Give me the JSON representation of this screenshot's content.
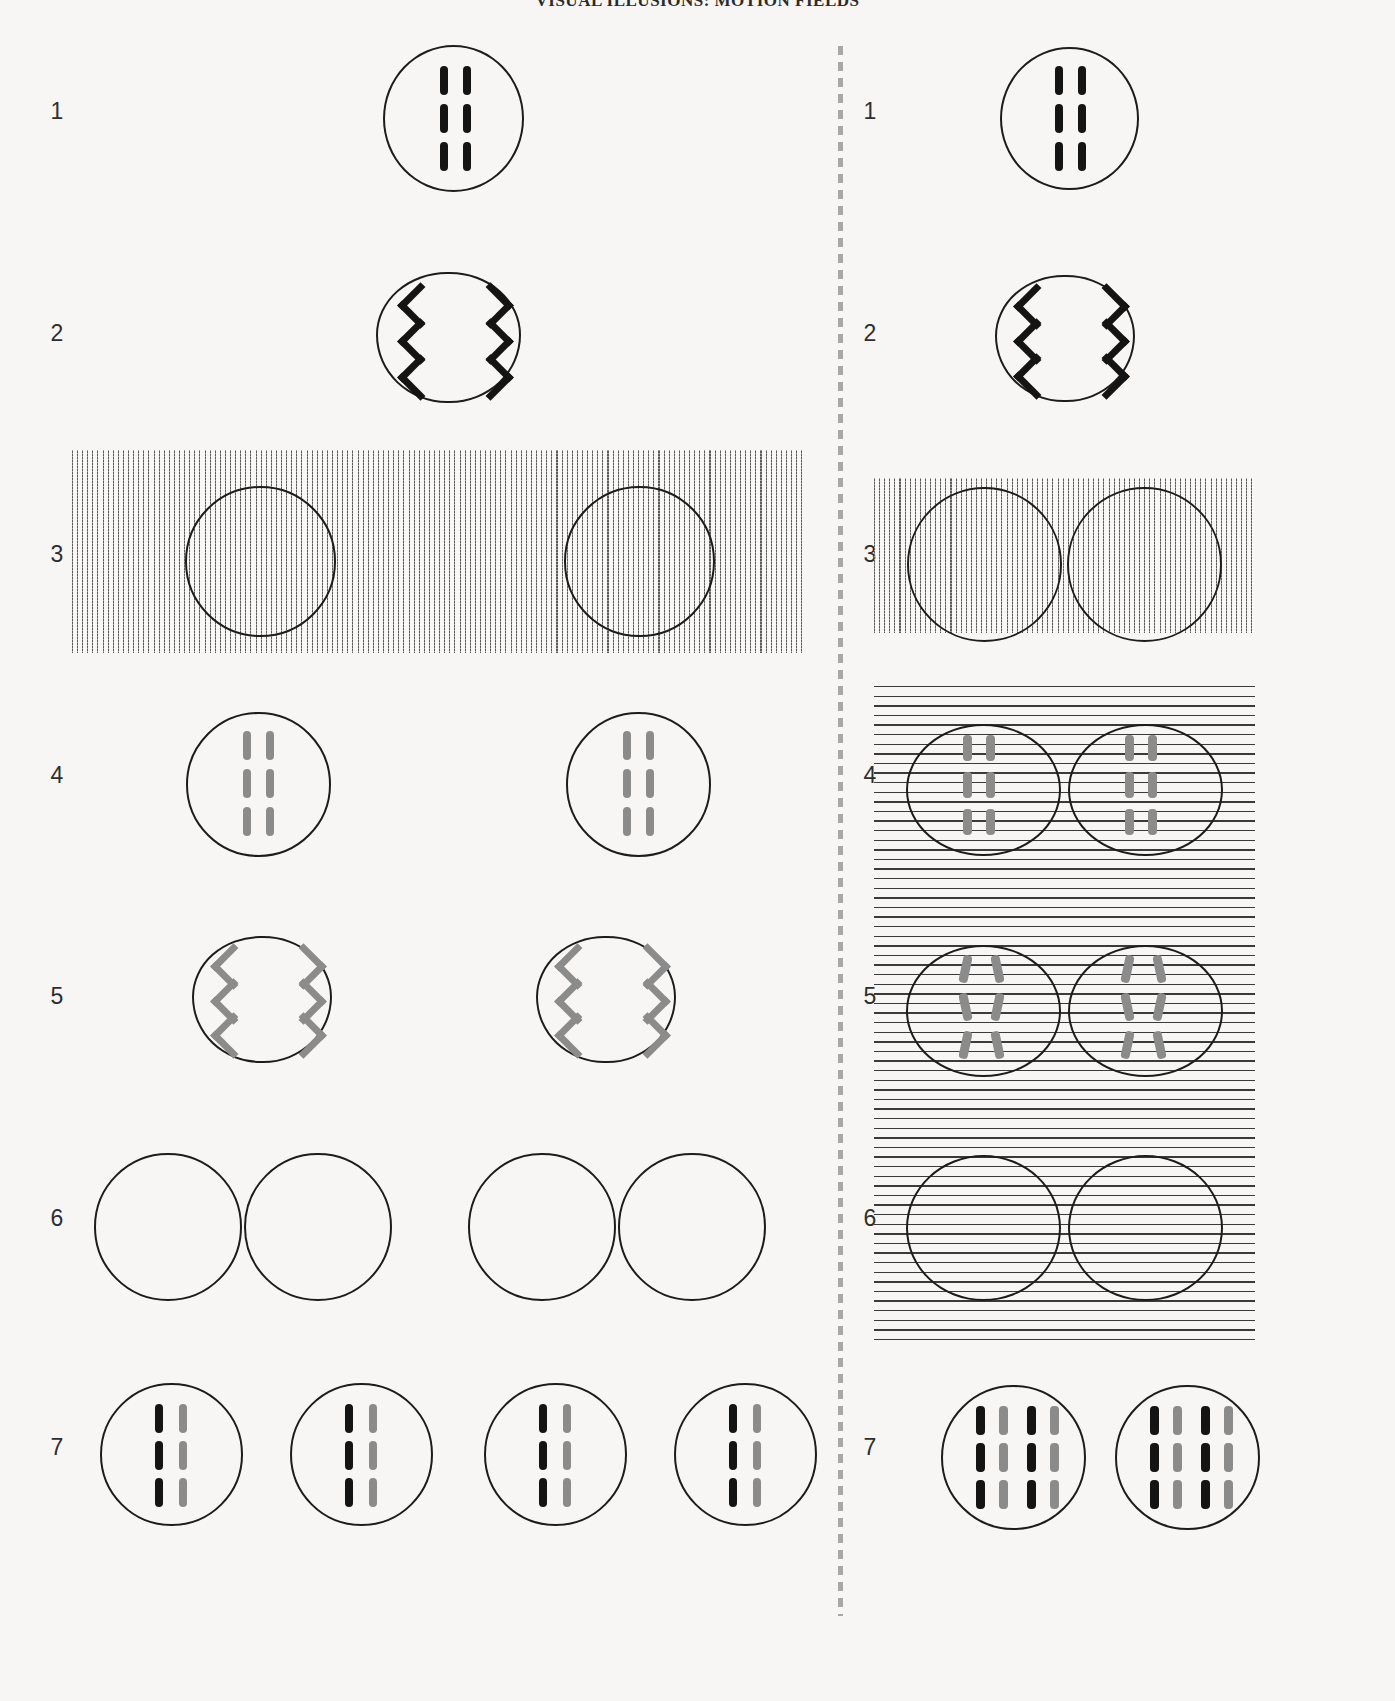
{
  "plate": {
    "title": "VISUAL ILLUSIONS: MOTION FIELDS",
    "background_color": "#f7f6f4",
    "ink_black": "#141414",
    "ink_gray": "#8b8b8b",
    "divider_style": "dashed-vertical",
    "columns": 2
  },
  "row_numbers": {
    "r1": "1",
    "r2": "2",
    "r3": "3",
    "r4": "4",
    "r5": "5",
    "r6": "6",
    "r7": "7"
  },
  "left_column": {
    "rows": [
      {
        "number": "1",
        "description": "single circle containing six black vertical bars in three rows of two",
        "circles": 1,
        "bar_color": "#141414",
        "bar_orientation": "vertical",
        "bar_rows": 3,
        "bar_cols": 2,
        "background_field": "none"
      },
      {
        "number": "2",
        "description": "single scalloped circle containing three pairs of black chevrons pointing outward",
        "circles": 1,
        "glyph": "chevron",
        "glyph_color": "#141414",
        "glyph_rows": 3,
        "background_field": "none"
      },
      {
        "number": "3",
        "description": "wide field of fine vertical lines with two empty outlined circles spaced apart",
        "circles": 2,
        "background_field": "vertical-lines",
        "field_width_px": 730
      },
      {
        "number": "4",
        "description": "two separated circles each with six gray vertical bars",
        "circles": 2,
        "bar_color": "#8b8b8b",
        "bar_orientation": "vertical",
        "bar_rows": 3,
        "bar_cols": 2,
        "background_field": "none"
      },
      {
        "number": "5",
        "description": "two separated scalloped circles each with three pairs of gray chevrons",
        "circles": 2,
        "glyph": "chevron",
        "glyph_color": "#8b8b8b",
        "glyph_rows": 3,
        "background_field": "none"
      },
      {
        "number": "6",
        "description": "four empty outlined circles arranged as two touching pairs",
        "circles": 4,
        "background_field": "none"
      },
      {
        "number": "7",
        "description": "four circles each with three rows of one black bar beside one gray bar",
        "circles": 4,
        "bar_colors": [
          "#141414",
          "#8b8b8b"
        ],
        "bar_orientation": "vertical",
        "bar_rows": 3,
        "bar_cols": 2,
        "background_field": "none"
      }
    ]
  },
  "right_column": {
    "rows": [
      {
        "number": "1",
        "description": "single circle containing six black vertical bars in three rows of two",
        "circles": 1,
        "bar_color": "#141414",
        "bar_orientation": "vertical",
        "bar_rows": 3,
        "bar_cols": 2,
        "background_field": "none"
      },
      {
        "number": "2",
        "description": "single scalloped circle containing three pairs of black chevrons pointing outward",
        "circles": 1,
        "glyph": "chevron",
        "glyph_color": "#141414",
        "glyph_rows": 3,
        "background_field": "none"
      },
      {
        "number": "3",
        "description": "field of fine vertical lines with two touching empty outlined circles",
        "circles": 2,
        "background_field": "vertical-lines",
        "field_width_px": 380
      },
      {
        "number": "4",
        "description": "horizontal line field with two touching circles each holding six gray vertical bars",
        "circles": 2,
        "bar_color": "#8b8b8b",
        "bar_orientation": "vertical",
        "bar_rows": 3,
        "bar_cols": 2,
        "background_field": "horizontal-lines"
      },
      {
        "number": "5",
        "description": "horizontal line field with two touching circles each holding three rows of oppositely tilted gray bars",
        "circles": 2,
        "bar_color": "#8b8b8b",
        "bar_orientation": "tilted-opposed",
        "bar_rows": 3,
        "bar_cols": 2,
        "background_field": "horizontal-lines"
      },
      {
        "number": "6",
        "description": "horizontal line field with two touching empty outlined circles",
        "circles": 2,
        "background_field": "horizontal-lines"
      },
      {
        "number": "7",
        "description": "two circles each with three rows of four alternating black and gray vertical bars",
        "circles": 2,
        "bar_colors": [
          "#141414",
          "#8b8b8b",
          "#141414",
          "#8b8b8b"
        ],
        "bar_orientation": "vertical",
        "bar_rows": 3,
        "bar_cols": 4,
        "background_field": "none"
      }
    ]
  }
}
